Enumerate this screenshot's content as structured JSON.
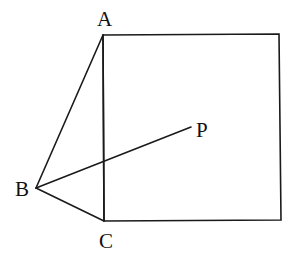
{
  "diagram": {
    "type": "geometry-figure",
    "points": {
      "A": {
        "label": "A"
      },
      "B": {
        "label": "B"
      },
      "C": {
        "label": "C"
      },
      "P": {
        "label": "P"
      }
    },
    "segments": [
      {
        "from": "A",
        "to": "B"
      },
      {
        "from": "B",
        "to": "C"
      },
      {
        "from": "B",
        "to": "P"
      },
      {
        "from": "A",
        "to": "C"
      }
    ],
    "shapes": [
      {
        "type": "square",
        "side": "AC",
        "note": "square built on side AC, extending to the right"
      }
    ],
    "colors": {
      "stroke": "#1a1a1a",
      "background": "#ffffff"
    }
  }
}
